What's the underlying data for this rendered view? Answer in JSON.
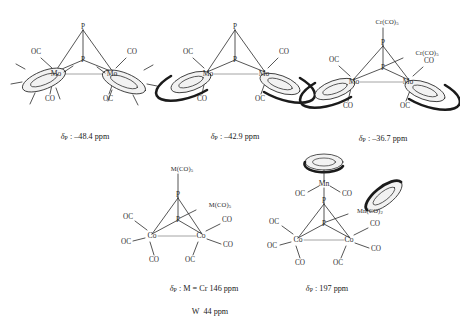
{
  "figure": {
    "kind": "chemical-structure-panel",
    "background": "#ffffff",
    "line_color": "#2a2a2a",
    "ring_fill": "#f2f2f2",
    "structures": [
      {
        "id": "s1",
        "name": "Cp*2Mo2(CO)4(P2)",
        "core": "P2 tetrahedrane bridging two Mo",
        "atoms": [
          "P",
          "P",
          "Mo",
          "Mo"
        ],
        "ring_type": "Cp*",
        "ligand_labels": [
          "OC",
          "CO",
          "CO",
          "OC"
        ],
        "apex_labels": [
          "P",
          "P"
        ],
        "metal_labels": [
          "Mo",
          "Mo"
        ],
        "caption_delta": "δ",
        "caption_sub": "P",
        "caption_value": " : –48.4 ppm"
      },
      {
        "id": "s2",
        "name": "Cp2Mo2(CO)4(P2)",
        "core": "P2 tetrahedrane bridging two Mo",
        "atoms": [
          "P",
          "P",
          "Mo",
          "Mo"
        ],
        "ring_type": "Cp",
        "ligand_labels": [
          "OC",
          "CO",
          "CO",
          "OC"
        ],
        "apex_labels": [
          "P",
          "P"
        ],
        "metal_labels": [
          "Mo",
          "Mo"
        ],
        "caption_delta": "δ",
        "caption_sub": "P",
        "caption_value": " : –42.9 ppm"
      },
      {
        "id": "s3",
        "name": "Cp2Mo2(CO)4(P2)[Cr(CO)5]2",
        "core": "P2 tetrahedrane bridging two Mo with two Cr(CO)5 adducts",
        "atoms": [
          "P",
          "P",
          "Mo",
          "Mo"
        ],
        "ring_type": "Cp",
        "ligand_labels": [
          "OC",
          "CO",
          "CO",
          "OC"
        ],
        "apex_labels": [
          "P",
          "P"
        ],
        "metal_labels": [
          "Mo",
          "Mo"
        ],
        "adduct_top": "Cr(CO)",
        "adduct_top_sub": "5",
        "adduct_side": "Cr(CO)",
        "adduct_side_sub": "5",
        "caption_delta": "δ",
        "caption_sub": "P",
        "caption_value": " : –36.7 ppm"
      },
      {
        "id": "s4",
        "name": "Co2(CO)6(P2)[M(CO)5]2",
        "core": "P2 tetrahedrane bridging two Co with two M(CO)5 adducts",
        "atoms": [
          "P",
          "P",
          "Co",
          "Co"
        ],
        "ligand_labels": [
          "OC",
          "OC",
          "CO",
          "CO",
          "CO",
          "OC"
        ],
        "apex_labels": [
          "P",
          "P"
        ],
        "metal_labels": [
          "Co",
          "Co"
        ],
        "adduct_top": "M(CO)",
        "adduct_top_sub": "5",
        "adduct_side": "M(CO)",
        "adduct_side_sub": "5",
        "caption_delta": "δ",
        "caption_sub": "P",
        "caption_line1": " : M = Cr 146 ppm",
        "caption_line2": "W  44 ppm"
      },
      {
        "id": "s5",
        "name": "Co2(CO)6(P2)[CpMn(CO)2]2",
        "core": "P2 tetrahedrane bridging two Co with two CpMn(CO)2 adducts",
        "atoms": [
          "P",
          "P",
          "Co",
          "Co",
          "Mn",
          "Mn"
        ],
        "ring_type": "Cp",
        "ligand_labels": [
          "OC",
          "OC",
          "CO",
          "CO",
          "CO",
          "OC"
        ],
        "apex_labels": [
          "P",
          "P"
        ],
        "metal_labels": [
          "Co",
          "Co"
        ],
        "mn_top_label": "Mn",
        "mn_top_co_left": "OC",
        "mn_top_co_right": "CO",
        "adduct_side": "Mn(CO)",
        "adduct_side_sub": "2",
        "caption_delta": "δ",
        "caption_sub": "P",
        "caption_value": " : 197 ppm"
      }
    ]
  }
}
